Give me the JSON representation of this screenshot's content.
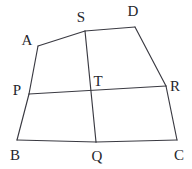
{
  "figure": {
    "background_color": "#ffffff",
    "line_color": "#3a3a42",
    "label_color": "#26262c",
    "canvas": {
      "width": 192,
      "height": 169
    },
    "points": [
      {
        "id": "A",
        "label": "A",
        "x": 38,
        "y": 46,
        "label_x": 27,
        "label_y": 40
      },
      {
        "id": "D",
        "label": "D",
        "x": 135,
        "y": 27,
        "label_x": 133,
        "label_y": 11
      },
      {
        "id": "B",
        "label": "B",
        "x": 17,
        "y": 140,
        "label_x": 15,
        "label_y": 155
      },
      {
        "id": "C",
        "label": "C",
        "x": 177,
        "y": 140,
        "label_x": 179,
        "label_y": 155
      },
      {
        "id": "S",
        "label": "S",
        "x": 85,
        "y": 31,
        "label_x": 81,
        "label_y": 17
      },
      {
        "id": "Q",
        "label": "Q",
        "x": 96,
        "y": 142,
        "label_x": 97,
        "label_y": 156
      },
      {
        "id": "P",
        "label": "P",
        "x": 29,
        "y": 94,
        "label_x": 17,
        "label_y": 90
      },
      {
        "id": "R",
        "label": "R",
        "x": 166,
        "y": 86,
        "label_x": 175,
        "label_y": 86
      },
      {
        "id": "T",
        "label": "T",
        "x": 91,
        "y": 91,
        "label_x": 98,
        "label_y": 81
      }
    ],
    "segments": [
      {
        "id": "AS",
        "from": "A",
        "to": "S",
        "d": "M 38 46 L 85 31"
      },
      {
        "id": "SD",
        "from": "S",
        "to": "D",
        "d": "M 85 31 L 135 27"
      },
      {
        "id": "DC",
        "from": "D",
        "to": "R",
        "d": "M 135 27 L 166 86"
      },
      {
        "id": "RC",
        "from": "R",
        "to": "C",
        "d": "M 166 86 L 177 140"
      },
      {
        "id": "CQ",
        "from": "C",
        "to": "Q",
        "d": "M 177 140 L 96 142"
      },
      {
        "id": "QB",
        "from": "Q",
        "to": "B",
        "d": "M 96 142 L 17 140"
      },
      {
        "id": "BP",
        "from": "B",
        "to": "P",
        "d": "M 17 140 L 29 94"
      },
      {
        "id": "PA",
        "from": "P",
        "to": "A",
        "d": "M 29 94 L 38 46"
      },
      {
        "id": "PR",
        "from": "P",
        "to": "R",
        "d": "M 29 94 L 166 86"
      },
      {
        "id": "SQ",
        "from": "S",
        "to": "Q",
        "d": "M 85 31 L 96 142"
      }
    ]
  }
}
